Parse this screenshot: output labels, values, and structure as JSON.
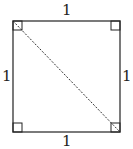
{
  "diagram": {
    "type": "square-with-diagonal",
    "labels": {
      "top": "1",
      "left": "1",
      "right": "1",
      "bottom": "1"
    },
    "right_angle_markers": [
      "top-left",
      "top-right",
      "bottom-left",
      "bottom-right"
    ],
    "diagonal": {
      "from": "top-left",
      "to": "bottom-right",
      "style": "dashed"
    },
    "stroke_color": "#222222"
  }
}
